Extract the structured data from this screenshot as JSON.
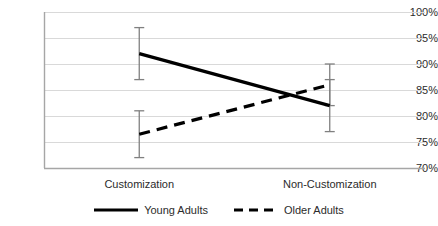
{
  "chart_data": {
    "type": "line",
    "title": "",
    "subtitle": "",
    "xlabel": "",
    "ylabel": "",
    "categories": [
      "Customization",
      "Non-Customization"
    ],
    "ytick_labels": [
      "70%",
      "75%",
      "80%",
      "85%",
      "90%",
      "95%",
      "100%"
    ],
    "ytick_values": [
      70,
      75,
      80,
      85,
      90,
      95,
      100
    ],
    "ylim": [
      70,
      100
    ],
    "grid": "horizontal",
    "legend_position": "bottom",
    "series": [
      {
        "name": "Young Adults",
        "style": "solid",
        "color": "#000000",
        "values": [
          92,
          82
        ],
        "error_low": [
          87,
          77
        ],
        "error_high": [
          97,
          87
        ]
      },
      {
        "name": "Older Adults",
        "style": "dashed",
        "color": "#000000",
        "values": [
          76.5,
          86
        ],
        "error_low": [
          72,
          82
        ],
        "error_high": [
          81,
          90
        ]
      }
    ]
  },
  "axis": {
    "y_axis_color": "#a6a6a6",
    "x_axis_color": "#a6a6a6",
    "gridline_color": "#d9d9d9",
    "errorbar_color": "#808080"
  }
}
